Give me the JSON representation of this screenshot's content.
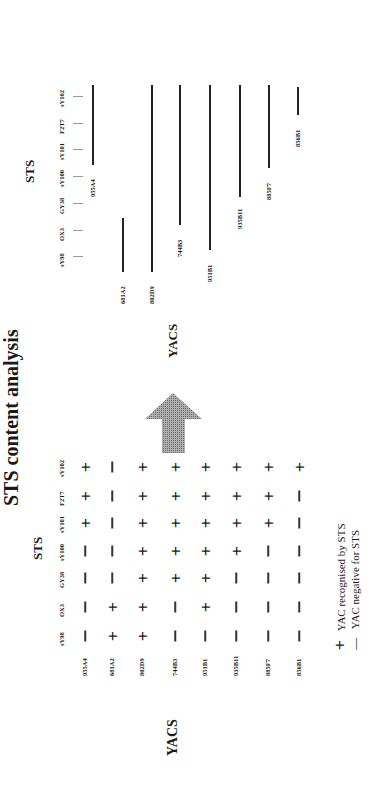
{
  "title": "STS content analysis",
  "table": {
    "sts_heading": "STS",
    "yacs_heading": "YACS",
    "sts_markers": [
      "sY98",
      "OX3",
      "GY38",
      "sY100",
      "sY101",
      "F2T7",
      "sY102"
    ],
    "yacs": [
      "955A4",
      "681A2",
      "802D9",
      "744B3",
      "951B1",
      "935B11",
      "885F7",
      "856B1"
    ],
    "rows": [
      {
        "yac": "955A4",
        "cells": [
          "-",
          "-",
          "-",
          "-",
          "+",
          "+",
          "+"
        ]
      },
      {
        "yac": "681A2",
        "cells": [
          "+",
          "+",
          "-",
          "-",
          "-",
          "-",
          "-"
        ]
      },
      {
        "yac": "802D9",
        "cells": [
          "+",
          "+",
          "+",
          "+",
          "+",
          "+",
          "+"
        ]
      },
      {
        "yac": "744B3",
        "cells": [
          "-",
          "-",
          "+",
          "+",
          "+",
          "+",
          "+"
        ]
      },
      {
        "yac": "951B1",
        "cells": [
          "-",
          "+",
          "+",
          "+",
          "+",
          "+",
          "+"
        ]
      },
      {
        "yac": "935B11",
        "cells": [
          "-",
          "-",
          "-",
          "+",
          "+",
          "+",
          "+"
        ]
      },
      {
        "yac": "885F7",
        "cells": [
          "-",
          "-",
          "-",
          "-",
          "+",
          "+",
          "+"
        ]
      },
      {
        "yac": "856B1",
        "cells": [
          "-",
          "-",
          "-",
          "-",
          "-",
          "-",
          "+"
        ]
      }
    ]
  },
  "legend": {
    "plus_symbol": "+",
    "plus_label": "YAC recognised by STS",
    "minus_symbol": "—",
    "minus_label": "YAC negative for STS"
  },
  "arrow": {
    "label": "YACS",
    "color": "#8c8c8c"
  },
  "map": {
    "sts_heading": "STS",
    "sts_markers": [
      "sY98",
      "OX3",
      "GY38",
      "sY100",
      "sY101",
      "F2T7",
      "sY102"
    ],
    "contigs": [
      {
        "yac": "955A4",
        "from": "sY101",
        "to": "sY102"
      },
      {
        "yac": "681A2",
        "from": "sY98",
        "to": "OX3"
      },
      {
        "yac": "802D9",
        "from": "sY98",
        "to": "sY102"
      },
      {
        "yac": "744B3",
        "from": "OX3",
        "to": "sY102"
      },
      {
        "yac": "951B1",
        "from": "sY98",
        "to": "sY102"
      },
      {
        "yac": "935B11",
        "from": "GY38",
        "to": "sY102"
      },
      {
        "yac": "885F7",
        "from": "sY101",
        "to": "sY102"
      },
      {
        "yac": "856B1",
        "from": "F2T7",
        "to": "sY102"
      }
    ]
  }
}
